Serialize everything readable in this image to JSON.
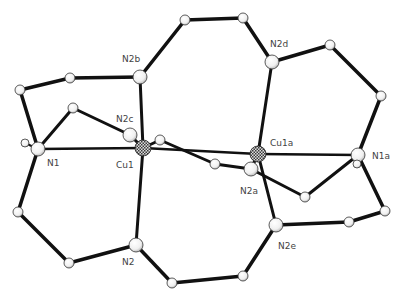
{
  "colors": {
    "bond": "#111111",
    "atom_fill": "#f2f2f2",
    "atom_stroke": "#333333",
    "cu_fill": "#555555",
    "label": "#444444"
  },
  "atoms": [
    {
      "id": "Cu1",
      "label": "Cu1",
      "x": 143,
      "y": 148,
      "r": 8,
      "type": "Cu",
      "lx": 116,
      "ly": 168
    },
    {
      "id": "Cu1a",
      "label": "Cu1a",
      "x": 258,
      "y": 154,
      "r": 8,
      "type": "Cu",
      "lx": 270,
      "ly": 146
    },
    {
      "id": "N1",
      "label": "N1",
      "x": 38,
      "y": 149,
      "r": 7,
      "type": "N",
      "lx": 47,
      "ly": 166
    },
    {
      "id": "N1a",
      "label": "N1a",
      "x": 358,
      "y": 155,
      "r": 7,
      "type": "N",
      "lx": 372,
      "ly": 159
    },
    {
      "id": "N2",
      "label": "N2",
      "x": 136,
      "y": 245,
      "r": 7,
      "type": "N",
      "lx": 122,
      "ly": 265
    },
    {
      "id": "N2a",
      "label": "N2a",
      "x": 251,
      "y": 169,
      "r": 7,
      "type": "N",
      "lx": 240,
      "ly": 194
    },
    {
      "id": "N2b",
      "label": "N2b",
      "x": 140,
      "y": 77,
      "r": 7,
      "type": "N",
      "lx": 122,
      "ly": 62
    },
    {
      "id": "N2c",
      "label": "N2c",
      "x": 130,
      "y": 135,
      "r": 7,
      "type": "N",
      "lx": 116,
      "ly": 122
    },
    {
      "id": "N2d",
      "label": "N2d",
      "x": 272,
      "y": 62,
      "r": 7,
      "type": "N",
      "lx": 270,
      "ly": 47
    },
    {
      "id": "N2e",
      "label": "N2e",
      "x": 276,
      "y": 225,
      "r": 7,
      "type": "N",
      "lx": 278,
      "ly": 249
    },
    {
      "id": "C1",
      "label": "",
      "x": 185,
      "y": 20,
      "r": 5,
      "type": "C"
    },
    {
      "id": "C2",
      "label": "",
      "x": 243,
      "y": 18,
      "r": 5,
      "type": "C"
    },
    {
      "id": "C3",
      "label": "",
      "x": 330,
      "y": 45,
      "r": 5,
      "type": "C"
    },
    {
      "id": "C4",
      "label": "",
      "x": 381,
      "y": 96,
      "r": 5,
      "type": "C"
    },
    {
      "id": "C5",
      "label": "",
      "x": 70,
      "y": 78,
      "r": 5,
      "type": "C"
    },
    {
      "id": "C6",
      "label": "",
      "x": 20,
      "y": 90,
      "r": 5,
      "type": "C"
    },
    {
      "id": "C7",
      "label": "",
      "x": 73,
      "y": 108,
      "r": 5,
      "type": "C"
    },
    {
      "id": "C8",
      "label": "",
      "x": 25,
      "y": 143,
      "r": 4,
      "type": "C"
    },
    {
      "id": "C9",
      "label": "",
      "x": 160,
      "y": 140,
      "r": 5,
      "type": "C"
    },
    {
      "id": "C10",
      "label": "",
      "x": 215,
      "y": 164,
      "r": 5,
      "type": "C"
    },
    {
      "id": "C11",
      "label": "",
      "x": 357,
      "y": 164,
      "r": 4,
      "type": "C"
    },
    {
      "id": "C12",
      "label": "",
      "x": 305,
      "y": 197,
      "r": 5,
      "type": "C"
    },
    {
      "id": "C13",
      "label": "",
      "x": 385,
      "y": 211,
      "r": 5,
      "type": "C"
    },
    {
      "id": "C14",
      "label": "",
      "x": 349,
      "y": 222,
      "r": 5,
      "type": "C"
    },
    {
      "id": "C15",
      "label": "",
      "x": 18,
      "y": 212,
      "r": 5,
      "type": "C"
    },
    {
      "id": "C16",
      "label": "",
      "x": 69,
      "y": 263,
      "r": 5,
      "type": "C"
    },
    {
      "id": "C17",
      "label": "",
      "x": 172,
      "y": 283,
      "r": 5,
      "type": "C"
    },
    {
      "id": "C18",
      "label": "",
      "x": 243,
      "y": 276,
      "r": 5,
      "type": "C"
    }
  ],
  "bonds": [
    {
      "a": "Cu1",
      "b": "Cu1a",
      "w": 2.5
    },
    {
      "a": "N1",
      "b": "Cu1",
      "w": 2.5
    },
    {
      "a": "Cu1a",
      "b": "N1a",
      "w": 2.5
    },
    {
      "a": "Cu1",
      "b": "N2b",
      "w": 3
    },
    {
      "a": "Cu1",
      "b": "N2",
      "w": 3
    },
    {
      "a": "Cu1",
      "b": "N2c",
      "w": 3
    },
    {
      "a": "Cu1a",
      "b": "N2d",
      "w": 3
    },
    {
      "a": "Cu1a",
      "b": "N2e",
      "w": 3
    },
    {
      "a": "Cu1a",
      "b": "N2a",
      "w": 3
    },
    {
      "a": "N2b",
      "b": "C5",
      "w": 3.5
    },
    {
      "a": "C5",
      "b": "C6",
      "w": 3.5
    },
    {
      "a": "C6",
      "b": "N1",
      "w": 3.5
    },
    {
      "a": "N2b",
      "b": "C1",
      "w": 3.5
    },
    {
      "a": "C1",
      "b": "C2",
      "w": 3.5
    },
    {
      "a": "C2",
      "b": "N2d",
      "w": 3.5
    },
    {
      "a": "N2d",
      "b": "C3",
      "w": 3.5
    },
    {
      "a": "C3",
      "b": "C4",
      "w": 3.5
    },
    {
      "a": "C4",
      "b": "N1a",
      "w": 3.5
    },
    {
      "a": "N1",
      "b": "C7",
      "w": 3
    },
    {
      "a": "C7",
      "b": "N2c",
      "w": 3
    },
    {
      "a": "N1",
      "b": "C15",
      "w": 3.5
    },
    {
      "a": "C15",
      "b": "C16",
      "w": 3.5
    },
    {
      "a": "C16",
      "b": "N2",
      "w": 3.5
    },
    {
      "a": "N2",
      "b": "C17",
      "w": 3.5
    },
    {
      "a": "C17",
      "b": "C18",
      "w": 3.5
    },
    {
      "a": "C18",
      "b": "N2e",
      "w": 3.5
    },
    {
      "a": "N2e",
      "b": "C14",
      "w": 3.5
    },
    {
      "a": "C14",
      "b": "C13",
      "w": 3.5
    },
    {
      "a": "C13",
      "b": "N1a",
      "w": 3.5
    },
    {
      "a": "N1a",
      "b": "C12",
      "w": 3
    },
    {
      "a": "C12",
      "b": "N2a",
      "w": 3
    },
    {
      "a": "Cu1",
      "b": "C9",
      "w": 3
    },
    {
      "a": "C9",
      "b": "C10",
      "w": 3
    },
    {
      "a": "C10",
      "b": "N2a",
      "w": 3
    },
    {
      "a": "N1",
      "b": "C8",
      "w": 2
    },
    {
      "a": "N1a",
      "b": "C11",
      "w": 2
    }
  ]
}
